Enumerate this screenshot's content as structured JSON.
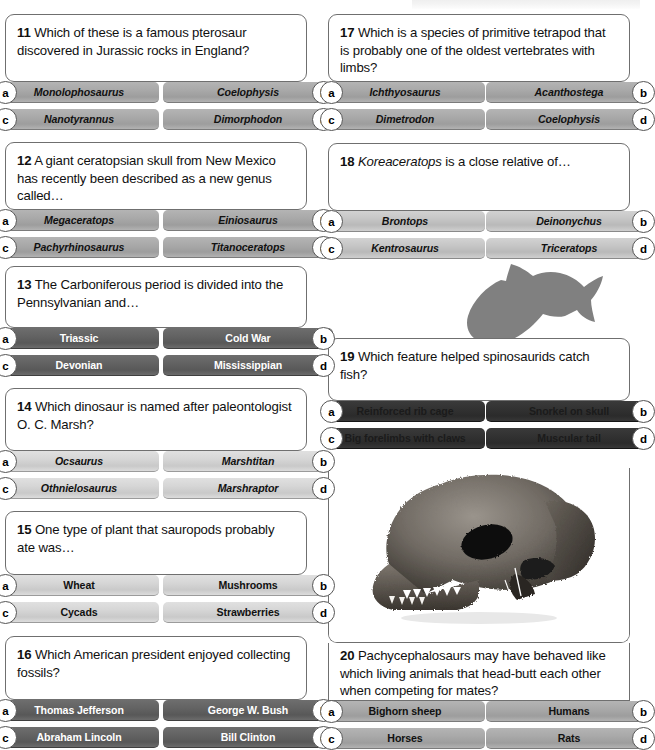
{
  "page": {
    "width": 640,
    "height": 750,
    "background": "#ffffff",
    "accent_dark": "#3a3a3a",
    "badge_border": "#555555",
    "card_border": "#6f6f6f"
  },
  "badges": {
    "a": "a",
    "b": "b",
    "c": "c",
    "d": "d"
  },
  "questions": [
    {
      "number": "11",
      "text": " Which of these is a famous pterosaur discovered in Jurassic rocks in England?",
      "italic_lead": "",
      "style": "mid",
      "italic_options": true,
      "options": {
        "a": "Monolophosaurus",
        "b": "Coelophysis",
        "c": "Nanotyrannus",
        "d": "Dimorphodon"
      }
    },
    {
      "number": "12",
      "text": " A giant ceratopsian skull from New Mexico has recently been described as a new genus called…",
      "italic_lead": "",
      "style": "mid",
      "italic_options": true,
      "options": {
        "a": "Megaceratops",
        "b": "Einiosaurus",
        "c": "Pachyrhinosaurus",
        "d": "Titanoceratops"
      }
    },
    {
      "number": "13",
      "text": " The Carboniferous period is divided into the Pennsylvanian and…",
      "italic_lead": "",
      "style": "dark",
      "italic_options": false,
      "options": {
        "a": "Triassic",
        "b": "Cold War",
        "c": "Devonian",
        "d": "Mississippian"
      }
    },
    {
      "number": "14",
      "text": " Which dinosaur is named after paleontologist O. C. Marsh?",
      "italic_lead": "",
      "style": "lighter",
      "italic_options": true,
      "options": {
        "a": "Ocsaurus",
        "b": "Marshtitan",
        "c": "Othnielosaurus",
        "d": "Marshraptor"
      }
    },
    {
      "number": "15",
      "text": " One type of plant that sauropods probably ate was…",
      "italic_lead": "",
      "style": "lighter",
      "italic_options": false,
      "options": {
        "a": "Wheat",
        "b": "Mushrooms",
        "c": "Cycads",
        "d": "Strawberries"
      }
    },
    {
      "number": "16",
      "text": " Which American president enjoyed collecting fossils?",
      "italic_lead": "",
      "style": "dark",
      "italic_options": false,
      "options": {
        "a": "Thomas Jefferson",
        "b": "George W. Bush",
        "c": "Abraham Lincoln",
        "d": "Bill Clinton"
      }
    },
    {
      "number": "17",
      "text": " Which is a species of primitive tetrapod that is probably one of the oldest vertebrates with limbs?",
      "italic_lead": "",
      "style": "mid",
      "italic_options": true,
      "options": {
        "a": "Ichthyosaurus",
        "b": "Acanthostega",
        "c": "Dimetrodon",
        "d": "Coelophysis"
      }
    },
    {
      "number": "18",
      "text": " is a close relative of…",
      "italic_lead": "Koreaceratops",
      "style": "light",
      "italic_options": true,
      "options": {
        "a": "Brontops",
        "b": "Deinonychus",
        "c": "Kentrosaurus",
        "d": "Triceratops"
      }
    },
    {
      "number": "19",
      "text": " Which feature helped spinosaurids catch fish?",
      "italic_lead": "",
      "style": "darkest",
      "italic_options": false,
      "options": {
        "a": "Reinforced rib cage",
        "b": "Snorkel on skull",
        "c": "Big forelimbs with claws",
        "d": "Muscular tail"
      }
    },
    {
      "number": "20",
      "text": " Pachycephalosaurs may have behaved like which living animals that head-butt each other when competing for mates?",
      "italic_lead": "",
      "style": "mid",
      "italic_options": false,
      "options": {
        "a": "Bighorn sheep",
        "b": "Humans",
        "c": "Horses",
        "d": "Rats"
      }
    }
  ],
  "images": {
    "fish_silhouette": "fish-silhouette",
    "skull_photo": "pachycephalosaur-skull-photo"
  }
}
